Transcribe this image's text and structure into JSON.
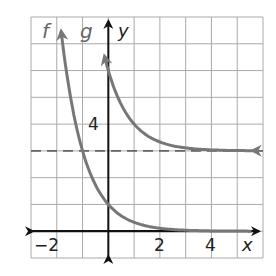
{
  "chart_data": {
    "type": "line",
    "title": "",
    "xlabel": "x",
    "ylabel": "y",
    "xlim": [
      -3,
      6
    ],
    "ylim": [
      -1,
      8
    ],
    "grid": true,
    "tick_labels": {
      "x": [
        "-2",
        "2",
        "4"
      ],
      "y": [
        "4"
      ]
    },
    "series": [
      {
        "name": "f",
        "label": "f",
        "equation_estimate": "y = 3^(-x)",
        "points": [
          [
            -1.8,
            7.2
          ],
          [
            -1.5,
            5.2
          ],
          [
            -1,
            3
          ],
          [
            -0.5,
            1.73
          ],
          [
            0,
            1
          ],
          [
            0.5,
            0.58
          ],
          [
            1,
            0.33
          ],
          [
            2,
            0.11
          ],
          [
            3,
            0.04
          ],
          [
            4,
            0.01
          ],
          [
            6,
            0.0
          ]
        ],
        "color": "#777777",
        "asymptote": 0
      },
      {
        "name": "g",
        "label": "g",
        "equation_estimate": "y = 3^(-(x-1)) + 3",
        "points": [
          [
            -0.1,
            6.2
          ],
          [
            0,
            6
          ],
          [
            0.5,
            4.73
          ],
          [
            1,
            4
          ],
          [
            1.5,
            3.58
          ],
          [
            2,
            3.33
          ],
          [
            3,
            3.11
          ],
          [
            4,
            3.04
          ],
          [
            5,
            3.01
          ],
          [
            5.7,
            3.0
          ]
        ],
        "color": "#777777",
        "asymptote": 3
      }
    ],
    "annotations": [
      {
        "type": "dashed_line",
        "y": 3,
        "description": "horizontal asymptote y = 3"
      }
    ],
    "axis_color": "#111111",
    "grid_color": "#aaaaaa"
  },
  "labels": {
    "f": "f",
    "g": "g",
    "x_axis": "x",
    "y_axis": "y",
    "tick_neg2": "−2",
    "tick_2": "2",
    "tick_4": "4",
    "tick_y4": "4"
  }
}
